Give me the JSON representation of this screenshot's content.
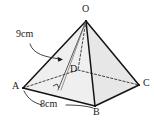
{
  "figure": {
    "type": "geometry-diagram",
    "shape": "square-pyramid",
    "vertices": {
      "apex": "O",
      "front_left": "A",
      "front_bottom": "B",
      "right": "C",
      "hidden_back": "D"
    },
    "labels": {
      "apex": "O",
      "a": "A",
      "b": "B",
      "c": "C",
      "d": "D"
    },
    "measurements": {
      "slant": "9cm",
      "base": "8cm"
    },
    "colors": {
      "stroke": "#1a1a1a",
      "hidden_stroke": "#3a3a3a",
      "face_fill": "#eeeeee",
      "face_fill_right": "#e8e8e8",
      "background": "#ffffff",
      "label_color": "#1a1a1a"
    },
    "annotations": {
      "right_angle": "right-angle-marker",
      "slant_leader": "curved-arrow-to-slant-edge",
      "base_leader": "arc-bracket-under-AB"
    }
  }
}
